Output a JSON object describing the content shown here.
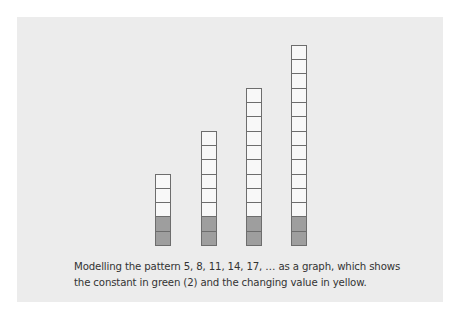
{
  "figure": {
    "caption_line1": "Modelling the pattern 5, 8, 11, 14, 17, … as a graph, which shows",
    "caption_line2": "the constant in green (2) and the changing value in yellow.",
    "columns": [
      {
        "term": 5,
        "constant": 2,
        "changing": 3,
        "left": 138
      },
      {
        "term": 8,
        "constant": 2,
        "changing": 6,
        "left": 184
      },
      {
        "term": 11,
        "constant": 2,
        "changing": 9,
        "left": 229
      },
      {
        "term": 14,
        "constant": 2,
        "changing": 12,
        "left": 274
      }
    ],
    "colors": {
      "background": "#ececec",
      "constant_cell": "#9e9e9e",
      "changing_cell": "#f8f8f8",
      "cell_border": "#6d6d6d"
    }
  }
}
